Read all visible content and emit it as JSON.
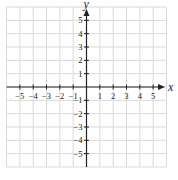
{
  "chart_data": {
    "type": "scatter",
    "title": "",
    "xlabel": "x",
    "ylabel": "y",
    "xlim": [
      -6,
      6
    ],
    "ylim": [
      -6,
      6
    ],
    "grid": true,
    "x_ticks": [
      -5,
      -4,
      -3,
      -2,
      -1,
      1,
      2,
      3,
      4,
      5
    ],
    "x_tick_labels": [
      "−5",
      "−4",
      "−3",
      "−2",
      "−1",
      "1",
      "2",
      "3",
      "4",
      "5"
    ],
    "y_ticks": [
      5,
      4,
      3,
      2,
      1,
      -1,
      -2,
      -3,
      -4,
      -5
    ],
    "y_tick_labels": [
      "5",
      "4",
      "3",
      "2",
      "1",
      "−1",
      "−2",
      "−3",
      "−4",
      "−5"
    ],
    "series": [],
    "legend": null
  },
  "colors": {
    "grid": "#d9d9d9",
    "axis": "#222222",
    "background": "#ffffff"
  }
}
